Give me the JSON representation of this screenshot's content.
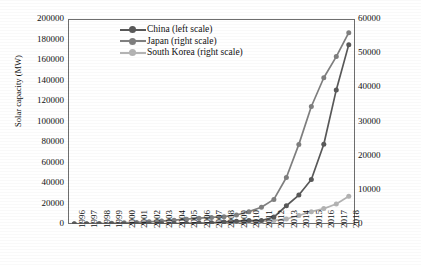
{
  "chart_data": {
    "type": "line",
    "title": "",
    "xlabel": "",
    "ylabel": "Solar capacity (MW)",
    "y2label": "",
    "grid": false,
    "legend_position": "top-left-inside",
    "categories": [
      "1996",
      "1997",
      "1998",
      "1999",
      "2000",
      "2001",
      "2002",
      "2003",
      "2004",
      "2005",
      "2006",
      "2007",
      "2008",
      "2009",
      "2010",
      "2011",
      "2012",
      "2013",
      "2014",
      "2015",
      "2016",
      "2017",
      "2018"
    ],
    "ylim": [
      0,
      200000
    ],
    "yticks": [
      "0",
      "20000",
      "40000",
      "60000",
      "80000",
      "100000",
      "120000",
      "140000",
      "160000",
      "180000",
      "200000"
    ],
    "y2lim": [
      0,
      60000
    ],
    "y2ticks": [
      "0",
      "10000",
      "20000",
      "30000",
      "40000",
      "50000",
      "60000"
    ],
    "series": [
      {
        "name": "China (left scale)",
        "axis": "left",
        "color": "#595959",
        "values": [
          0,
          10,
          20,
          40,
          70,
          100,
          150,
          250,
          400,
          600,
          900,
          1200,
          2000,
          2800,
          3300,
          3300,
          6800,
          17800,
          28200,
          43500,
          77800,
          130800,
          175000
        ]
      },
      {
        "name": "Japan (right scale)",
        "axis": "right",
        "color": "#7f7f7f",
        "values": [
          60,
          90,
          130,
          210,
          330,
          450,
          640,
          860,
          1130,
          1420,
          1710,
          1920,
          2150,
          2630,
          3620,
          4900,
          7200,
          13600,
          23300,
          34400,
          42800,
          49000,
          56000
        ]
      },
      {
        "name": "South Korea (right scale)",
        "axis": "right",
        "color": "#b3b3b3",
        "values": [
          1,
          2,
          3,
          4,
          5,
          6,
          8,
          10,
          12,
          14,
          36,
          81,
          358,
          524,
          655,
          730,
          1024,
          1478,
          2481,
          3615,
          4502,
          5835,
          8100
        ]
      }
    ]
  }
}
